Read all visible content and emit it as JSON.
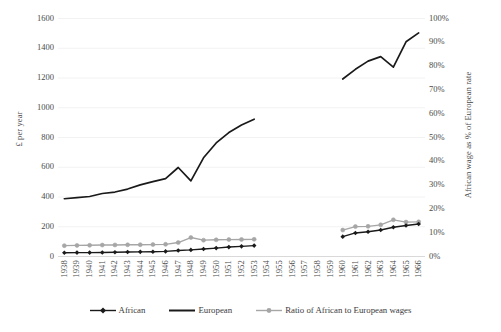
{
  "chart_data": {
    "type": "line",
    "title": "",
    "xlabel": "",
    "ylabel": "£ per year",
    "y2label": "African wage as % of European rate",
    "ylim": [
      0,
      1600
    ],
    "y2lim": [
      0,
      1
    ],
    "grid": true,
    "legend_position": "bottom",
    "categories": [
      "1938",
      "1939",
      "1940",
      "1941",
      "1942",
      "1943",
      "1944",
      "1945",
      "1946",
      "1947",
      "1948",
      "1949",
      "1950",
      "1951",
      "1952",
      "1953",
      "1954",
      "1955",
      "1956",
      "1957",
      "1958",
      "1959",
      "1960",
      "1961",
      "1962",
      "1963",
      "1964",
      "1965",
      "1966"
    ],
    "yticks": [
      "0",
      "200",
      "400",
      "600",
      "800",
      "1000",
      "1200",
      "1400",
      "1600"
    ],
    "y2ticks": [
      "0%",
      "10%",
      "20%",
      "30%",
      "40%",
      "50%",
      "60%",
      "70%",
      "80%",
      "90%",
      "100%"
    ],
    "series": [
      {
        "name": "African",
        "axis": "left",
        "color": "#1a1a1a",
        "marker": "diamond",
        "values": [
          22,
          23,
          23,
          24,
          25,
          27,
          28,
          29,
          31,
          37,
          41,
          47,
          53,
          60,
          65,
          70,
          null,
          null,
          null,
          null,
          null,
          null,
          130,
          155,
          163,
          175,
          193,
          205,
          215
        ]
      },
      {
        "name": "European",
        "axis": "left",
        "color": "#1a1a1a",
        "marker": "none",
        "values": [
          385,
          392,
          400,
          420,
          430,
          450,
          478,
          500,
          520,
          595,
          505,
          660,
          760,
          830,
          880,
          920,
          null,
          null,
          null,
          null,
          null,
          null,
          1190,
          1255,
          1310,
          1340,
          1270,
          1440,
          1500
        ]
      },
      {
        "name": "Ratio of African to European wages",
        "axis": "right",
        "color": "#a6a6a6",
        "marker": "circle",
        "values": [
          0.0435,
          0.0445,
          0.045,
          0.046,
          0.0465,
          0.047,
          0.0475,
          0.048,
          0.049,
          0.0565,
          0.0775,
          0.0665,
          0.068,
          0.069,
          0.0695,
          0.07,
          null,
          null,
          null,
          null,
          null,
          null,
          0.109,
          0.1235,
          0.1245,
          0.131,
          0.152,
          0.1425,
          0.1435
        ]
      }
    ]
  },
  "legend": {
    "items": [
      {
        "label": "African"
      },
      {
        "label": "European"
      },
      {
        "label": "Ratio of African to European wages"
      }
    ]
  },
  "axes": {
    "left_title": "£ per year",
    "right_title": "African wage as % of European rate"
  }
}
